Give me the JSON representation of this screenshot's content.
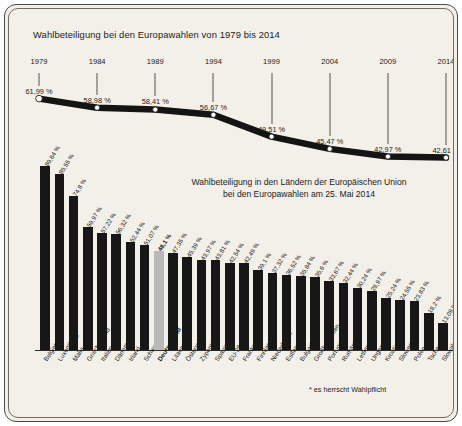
{
  "titles": {
    "main": "Wahlbeteiligung bei den Europawahlen von 1979 bis 2014",
    "sub_line1": "Wahlbeteiligung in den Ländern der Europäischen Union",
    "sub_line2": "bei den Europawahlen am 25. Mai 2014",
    "footnote": "* es herrscht Wahlpflicht"
  },
  "colors": {
    "background": "#f3f0e9",
    "bar": "#171717",
    "bar_highlight": "#b9b9b9",
    "text": "#1b1b1b",
    "border": "#4a4a4a"
  },
  "chart_data": [
    {
      "type": "line",
      "title": "Wahlbeteiligung bei den Europawahlen von 1979 bis 2014",
      "xlabel": "",
      "ylabel": "",
      "grid": false,
      "legend": "none",
      "ylim": [
        40,
        65
      ],
      "categories": [
        "1979",
        "1984",
        "1989",
        "1994",
        "1999",
        "2004",
        "2009",
        "2014"
      ],
      "values": [
        61.99,
        58.98,
        58.41,
        56.67,
        49.51,
        45.47,
        42.97,
        42.61
      ],
      "value_labels": [
        "61,99 %",
        "58,98 %",
        "58,41 %",
        "56,67 %",
        "49,51 %",
        "45,47 %",
        "42,97 %",
        "42,61 %"
      ]
    },
    {
      "type": "bar",
      "title": "Wahlbeteiligung in den Ländern der Europäischen Union bei den Europawahlen am 25. Mai 2014",
      "xlabel": "",
      "ylabel": "",
      "grid": false,
      "legend": "none",
      "ylim": [
        0,
        90
      ],
      "highlight_index": 8,
      "categories": [
        "Belgien*",
        "Luxemburg*",
        "Malta",
        "Griechenland",
        "Italien",
        "Dänemark",
        "Irland",
        "Schweden",
        "Deutschland",
        "Litauen",
        "Österreich",
        "Zypern*",
        "Spanien",
        "EU-28",
        "Frankreich",
        "Finnland",
        "Niederlande",
        "Estland",
        "Bulgarien",
        "Großbritannien",
        "Portugal",
        "Rumänien",
        "Lettland",
        "Ungarn",
        "Kroatien",
        "Slowenien",
        "Polen",
        "Tschechien",
        "Slowakei"
      ],
      "values": [
        89.64,
        85.55,
        74.8,
        59.97,
        57.22,
        56.32,
        52.44,
        51.07,
        48.1,
        47.35,
        45.39,
        43.97,
        43.81,
        42.54,
        42.49,
        39.1,
        37.32,
        36.52,
        35.84,
        35.6,
        33.67,
        32.44,
        30.24,
        28.97,
        25.24,
        24.55,
        23.83,
        18.2,
        13.09
      ],
      "value_labels": [
        "89,64 %",
        "85,55 %",
        "74,8 %",
        "59,97 %",
        "57,22 %",
        "56,32 %",
        "52,44 %",
        "51,07 %",
        "48,1 %",
        "47,35 %",
        "45,39 %",
        "43,97 %",
        "43,81 %",
        "42,54 %",
        "42,49 %",
        "39,1 %",
        "37,32 %",
        "36,52 %",
        "35,84 %",
        "35,6 %",
        "33,67 %",
        "32,44 %",
        "30,24 %",
        "28,97 %",
        "25,24 %",
        "24,55 %",
        "23,83 %",
        "18,2 %",
        "13,09 %"
      ]
    }
  ]
}
